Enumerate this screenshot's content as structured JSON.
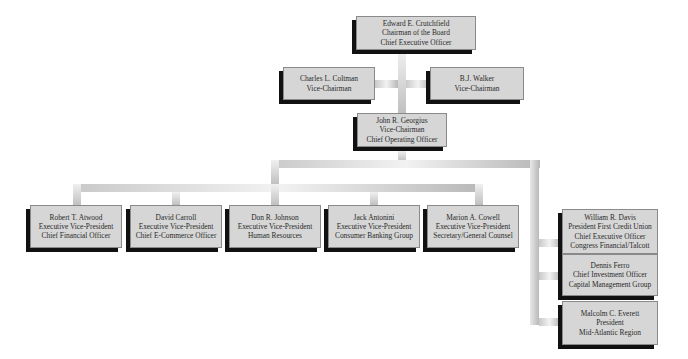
{
  "chart": {
    "nodes": [
      {
        "id": "crutchfield",
        "lines": [
          "Edward E. Crutchfield",
          "Chairman of the Board",
          "Chief Executive Officer"
        ]
      },
      {
        "id": "coltman",
        "lines": [
          "Charles L. Coltman",
          "Vice-Chairman"
        ]
      },
      {
        "id": "walker",
        "lines": [
          "B.J. Walker",
          "Vice-Chairman"
        ]
      },
      {
        "id": "georgius",
        "lines": [
          "John R. Georgius",
          "Vice-Chairman",
          "Chief Operating Officer"
        ]
      },
      {
        "id": "atwood",
        "lines": [
          "Robert T. Atwood",
          "Executive Vice-President",
          "Chief Financial Officer"
        ]
      },
      {
        "id": "carroll",
        "lines": [
          "David Carroll",
          "Executive Vice-President",
          "Chief E-Commerce Officer"
        ]
      },
      {
        "id": "johnson",
        "lines": [
          "Don R. Johnson",
          "Executive Vice-President",
          "Human Resources"
        ]
      },
      {
        "id": "antonini",
        "lines": [
          "Jack Antonini",
          "Executive Vice-President",
          "Consumer Banking Group"
        ]
      },
      {
        "id": "cowell",
        "lines": [
          "Marion A. Cowell",
          "Executive Vice-President",
          "Secretary/General Counsel"
        ]
      },
      {
        "id": "davis",
        "lines": [
          "William R. Davis",
          "President First Credit Union",
          "Chief Executive Officer",
          "Congress Financial/Talcott"
        ]
      },
      {
        "id": "ferro",
        "lines": [
          "Dennis Ferro",
          "Chief Investment Officer",
          "Capital Management Group"
        ]
      },
      {
        "id": "everett",
        "lines": [
          "Malcolm C. Everett",
          "President",
          "Mid-Atlantic Region"
        ]
      }
    ],
    "edges": [
      [
        "crutchfield",
        "georgius"
      ],
      [
        "crutchfield",
        "coltman"
      ],
      [
        "crutchfield",
        "walker"
      ],
      [
        "georgius",
        "atwood"
      ],
      [
        "georgius",
        "carroll"
      ],
      [
        "georgius",
        "johnson"
      ],
      [
        "georgius",
        "antonini"
      ],
      [
        "georgius",
        "cowell"
      ],
      [
        "georgius",
        "davis"
      ],
      [
        "georgius",
        "ferro"
      ],
      [
        "georgius",
        "everett"
      ]
    ],
    "colors": {
      "box_fill": "#d6d6d6",
      "box_shadow": "#111111",
      "text": "#2a2a2a",
      "connector": "#c0c0c0"
    }
  }
}
